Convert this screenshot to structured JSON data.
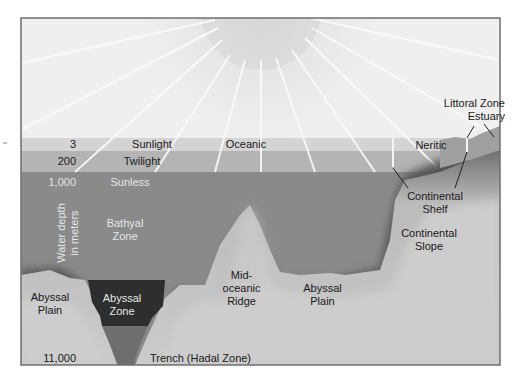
{
  "diagram": {
    "depth_axis": {
      "label_line1": "Water depth",
      "label_line2": "in meters",
      "ticks": [
        "3",
        "200",
        "1,000",
        "11,000"
      ]
    },
    "light_zones": {
      "sunlight": "Sunlight",
      "twilight": "Twilight",
      "sunless": "Sunless"
    },
    "horizontal_zones": {
      "oceanic": "Oceanic",
      "neritic": "Neritic",
      "littoral": "Littoral Zone",
      "estuary": "Estuary"
    },
    "depth_zones": {
      "bathyal_line1": "Bathyal",
      "bathyal_line2": "Zone",
      "abyssal_line1": "Abyssal",
      "abyssal_line2": "Zone",
      "hadal": "Trench (Hadal Zone)"
    },
    "features": {
      "abyssal_plain_left_line1": "Abyssal",
      "abyssal_plain_left_line2": "Plain",
      "ridge_line1": "Mid-",
      "ridge_line2": "oceanic",
      "ridge_line3": "Ridge",
      "abyssal_plain_right_line1": "Abyssal",
      "abyssal_plain_right_line2": "Plain",
      "shelf_line1": "Continental",
      "shelf_line2": "Shelf",
      "slope_line1": "Continental",
      "slope_line2": "Slope"
    },
    "colors": {
      "sky": "#ececec",
      "sunlight_band": "#d4d4d4",
      "twilight_band": "#b4b4b4",
      "deep_water": "#8a8a8a",
      "abyssal_zone": "#2e2e2e",
      "seafloor": "#c8c8c8",
      "frame": "#777777"
    }
  }
}
